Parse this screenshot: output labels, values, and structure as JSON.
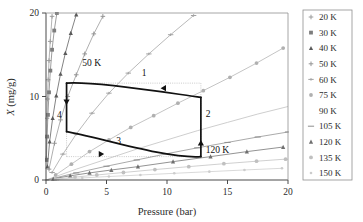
{
  "chart_data": {
    "type": "line",
    "title": "",
    "xlabel": "Pressure (bar)",
    "ylabel": "X (mg/g)",
    "ylabel_symbol": "X",
    "ylabel_units": " (mg/g)",
    "xlim": [
      0,
      20
    ],
    "ylim": [
      0,
      20
    ],
    "xticks": [
      "0",
      "5",
      "10",
      "15",
      "20"
    ],
    "xtick_values": [
      0,
      5,
      10,
      15,
      20
    ],
    "yticks": [
      "0",
      "10",
      "20"
    ],
    "ytick_values": [
      0,
      10,
      20
    ],
    "grid": false,
    "legend_position": "right-outside",
    "series": [
      {
        "name": "20 K",
        "label": "20 K",
        "marker": "plus",
        "color": "#9a9a9a",
        "x": [
          0.02,
          0.05,
          0.08,
          0.12,
          0.18,
          0.25,
          0.35,
          0.5
        ],
        "y": [
          2.6,
          5.1,
          7.4,
          9.7,
          12.0,
          14.3,
          16.6,
          19.6
        ]
      },
      {
        "name": "30 K",
        "label": "30 K",
        "marker": "square",
        "color": "#7d7d7d",
        "x": [
          0.03,
          0.09,
          0.16,
          0.25,
          0.36,
          0.5,
          0.68,
          0.9
        ],
        "y": [
          2.4,
          5.2,
          7.8,
          10.5,
          13.1,
          15.6,
          17.9,
          20.0
        ]
      },
      {
        "name": "40 K",
        "label": "40 K",
        "marker": "triangle",
        "color": "#5a5a5a",
        "x": [
          0.12,
          0.3,
          0.55,
          0.85,
          1.2,
          1.6,
          2.05,
          2.5
        ],
        "y": [
          1.6,
          4.6,
          7.4,
          10.1,
          12.7,
          15.2,
          17.6,
          19.8
        ]
      },
      {
        "name": "50 K",
        "label": "50 K",
        "marker": "plus",
        "color": "#949494",
        "x": [
          0.25,
          0.7,
          1.2,
          1.8,
          2.5,
          3.2,
          3.95,
          4.7
        ],
        "y": [
          1.3,
          4.4,
          7.2,
          10.0,
          12.6,
          15.1,
          17.5,
          19.6
        ]
      },
      {
        "name": "60 K",
        "label": "60 K",
        "marker": "plus-h",
        "color": "#a2a2a2",
        "x": [
          0.5,
          1.4,
          2.5,
          3.8,
          5.2,
          6.8,
          8.5,
          10.3,
          12.2
        ],
        "y": [
          0.9,
          3.1,
          5.5,
          8.0,
          10.4,
          12.8,
          15.1,
          17.4,
          19.7
        ]
      },
      {
        "name": "75 K",
        "label": "75 K",
        "marker": "circle",
        "color": "#b0b0b0",
        "x": [
          0.8,
          2.1,
          3.6,
          5.2,
          7.0,
          8.9,
          10.9,
          13.0,
          15.2,
          17.4,
          19.6
        ],
        "y": [
          0.6,
          1.9,
          3.4,
          4.8,
          6.3,
          7.7,
          9.2,
          10.7,
          12.3,
          14.0,
          15.8
        ]
      },
      {
        "name": "90 K",
        "label": "90 K",
        "marker": "none",
        "color": "#bdbdbd",
        "x": [
          0,
          2.5,
          5,
          7.5,
          10,
          12.5,
          15,
          17.5,
          20
        ],
        "y": [
          0,
          1.3,
          2.5,
          3.7,
          4.8,
          5.9,
          6.9,
          7.9,
          8.8
        ]
      },
      {
        "name": "105 K",
        "label": "105 K",
        "marker": "line",
        "color": "#8d8d8d",
        "x": [
          0,
          2.5,
          5,
          7.5,
          10,
          12.5,
          15,
          17.5,
          20
        ],
        "y": [
          0,
          0.85,
          1.65,
          2.4,
          3.15,
          3.85,
          4.5,
          5.15,
          5.75
        ]
      },
      {
        "name": "120 K",
        "label": "120 K",
        "marker": "triangle",
        "color": "#6f6f6f",
        "x": [
          0.6,
          2.0,
          3.6,
          5.4,
          7.6,
          10.5,
          13.6,
          16.6,
          19.6
        ],
        "y": [
          0.15,
          0.5,
          0.85,
          1.2,
          1.6,
          2.2,
          2.8,
          3.4,
          3.95
        ]
      },
      {
        "name": "135 K",
        "label": "135 K",
        "marker": "circle",
        "color": "#c0c0c0",
        "x": [
          0.8,
          2.4,
          4.2,
          6.4,
          9.0,
          11.8,
          14.7,
          17.4,
          19.8
        ],
        "y": [
          0.1,
          0.35,
          0.6,
          0.9,
          1.25,
          1.6,
          1.95,
          2.25,
          2.5
        ]
      },
      {
        "name": "150 K",
        "label": "150 K",
        "marker": "dot",
        "color": "#cccccc",
        "x": [
          1.0,
          3.0,
          5.2,
          7.8,
          10.6,
          13.5,
          16.4,
          19.5
        ],
        "y": [
          0.08,
          0.25,
          0.42,
          0.6,
          0.8,
          1.0,
          1.2,
          1.4
        ]
      }
    ],
    "cycle": {
      "name": "adsorption-cycle",
      "color": "#111111",
      "points": [
        {
          "x": 1.7,
          "y": 11.6
        },
        {
          "x": 12.8,
          "y": 9.9
        },
        {
          "x": 12.8,
          "y": 2.8
        },
        {
          "x": 1.7,
          "y": 5.8
        }
      ],
      "step_labels": [
        {
          "label": "1",
          "x": 8.1,
          "y": 12.5
        },
        {
          "label": "2",
          "x": 13.4,
          "y": 7.6
        },
        {
          "label": "3",
          "x": 6.0,
          "y": 4.3
        },
        {
          "label": "4",
          "x": 1.1,
          "y": 7.4
        }
      ]
    },
    "annotations": [
      {
        "label": "50 K",
        "x": 3.0,
        "y": 13.6
      },
      {
        "label": "120 K",
        "x": 13.2,
        "y": 3.2
      }
    ],
    "reference_lines": {
      "style": "dotted",
      "color": "#aaaaaa",
      "top_y": 11.6,
      "bottom_y": 2.8,
      "left_x": 1.7,
      "right_x": 12.8
    }
  }
}
